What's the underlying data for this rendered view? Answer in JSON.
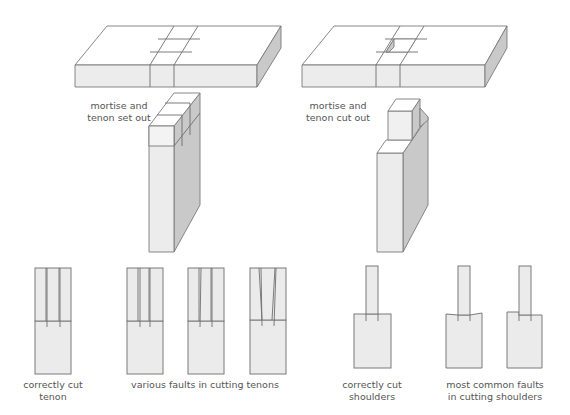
{
  "diagram": {
    "panels": [
      {
        "id": "set-out",
        "label_line1": "mortise and",
        "label_line2": "tenon set out"
      },
      {
        "id": "cut-out",
        "label_line1": "mortise and",
        "label_line2": "tenon cut out"
      }
    ],
    "tenon_examples": {
      "correct": {
        "label_line1": "correctly cut",
        "label_line2": "tenon"
      },
      "faults": {
        "label": "various faults in cutting tenons",
        "count": 3
      }
    },
    "shoulder_examples": {
      "correct": {
        "label_line1": "correctly cut",
        "label_line2": "shoulders"
      },
      "faults": {
        "label_line1": "most common faults",
        "label_line2": "in cutting shoulders",
        "count": 2
      }
    },
    "colors": {
      "outline": "#7a7a7a",
      "front_face": "#ececec",
      "side_face": "#c9c9c9",
      "top_face": "#ffffff",
      "text": "#555555"
    }
  }
}
